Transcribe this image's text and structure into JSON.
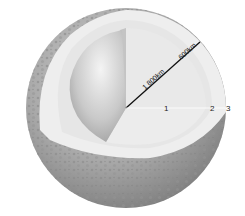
{
  "diagram": {
    "radius_labels": {
      "inner": "1 800km",
      "outer": "600km"
    },
    "layer_numbers": [
      "1",
      "2",
      "3"
    ],
    "colors": {
      "surface": "#a9a9a9",
      "crust_cut": "#ececec",
      "mantle_cut": "#e2e2e2",
      "core_sphere": "#cfcfcf",
      "radius_line": "#111111"
    }
  }
}
